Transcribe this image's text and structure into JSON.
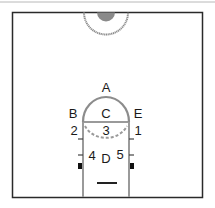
{
  "diagram": {
    "colors": {
      "court_line": "#2a2a2a",
      "lane_line": "#9a9a9a",
      "top_rule": "#b0b0b0",
      "fill_circle": "#888888",
      "label": "#1a1a1a"
    },
    "labels": {
      "A": "A",
      "B": "B",
      "C": "C",
      "D": "D",
      "E": "E",
      "p1": "1",
      "p2": "2",
      "p3": "3",
      "p4": "4",
      "p5": "5"
    }
  }
}
